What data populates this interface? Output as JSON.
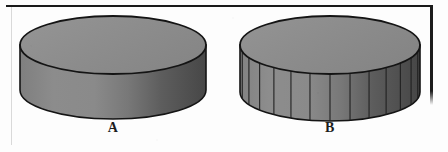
{
  "figure": {
    "background_color": "#fdfdfd",
    "outline_color": "#141414",
    "frame": {
      "top_rule_color": "#1a1a1a",
      "left_rule_color": "#d9d9d9",
      "right_rule_color": "#1c1c1c"
    }
  },
  "objects": [
    {
      "id": "cylinder-a",
      "label": "A",
      "shape": "cylinder",
      "segmented": false,
      "segment_count": 0,
      "top_face_fill": "#8e8e8e",
      "side_light_fill": "#8a8a8a",
      "side_dark_fill": "#4c4c4c",
      "outline_color": "#141414",
      "geometry": {
        "center_x": 113,
        "top_ellipse_center_y": 45,
        "radius_x": 93,
        "radius_y": 29,
        "body_height": 45
      }
    },
    {
      "id": "cylinder-b",
      "label": "B",
      "shape": "cylinder",
      "segmented": true,
      "segment_count": 14,
      "top_face_fill": "#8e8e8e",
      "side_light_fill": "#8a8a8a",
      "side_dark_fill": "#4c4c4c",
      "outline_color": "#141414",
      "segment_line_color": "#202020",
      "geometry": {
        "center_x": 330,
        "top_ellipse_center_y": 45,
        "radius_x": 90,
        "radius_y": 29,
        "body_height": 47
      }
    }
  ],
  "labels": {
    "a": "A",
    "b": "B"
  }
}
